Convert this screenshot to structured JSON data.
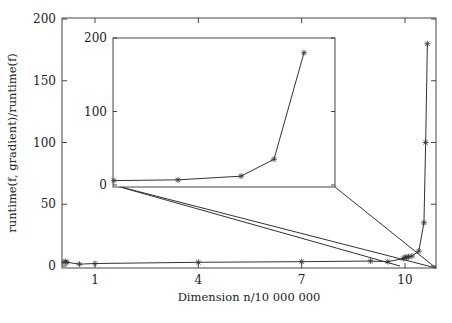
{
  "chart_data": [
    {
      "type": "line",
      "role": "main",
      "title": "",
      "xlabel": "Dimension n/10 000 000",
      "ylabel": "runtime(f, gradient)/runtime(f)",
      "xlim": [
        0.0,
        10.95
      ],
      "ylim": [
        0,
        200
      ],
      "xticks": [
        1,
        4,
        7,
        10
      ],
      "yticks": [
        0,
        50,
        100,
        150,
        200
      ],
      "grid": false,
      "legend": null,
      "series": [
        {
          "name": "runtime ratio",
          "marker": "asterisk",
          "x": [
            0.0,
            0.05,
            0.1,
            0.5,
            1.0,
            4.0,
            7.0,
            9.0,
            9.5,
            9.95,
            10.0,
            10.05,
            10.1,
            10.2,
            10.4,
            10.55,
            10.6,
            10.65
          ],
          "y": [
            3,
            3.5,
            3,
            1.5,
            2,
            3,
            3.5,
            4,
            3.5,
            6,
            7,
            7,
            7.5,
            8,
            12,
            35,
            100,
            180
          ]
        }
      ]
    },
    {
      "type": "line",
      "role": "inset",
      "title": "",
      "xlabel": "",
      "ylabel": "",
      "ylim": [
        0,
        200
      ],
      "yticks": [
        0,
        100,
        200
      ],
      "grid": false,
      "series": [
        {
          "name": "runtime ratio (zoom of dimension 10.0 - 10.65)",
          "marker": "asterisk",
          "x": [
            10.0,
            10.2,
            10.4,
            10.5,
            10.6
          ],
          "y": [
            6,
            7,
            12,
            35,
            180
          ]
        }
      ]
    }
  ],
  "labels": {
    "xlabel": "Dimension n/10 000 000",
    "ylabel": "runtime(f, gradient)/runtime(f)",
    "xticks": [
      "1",
      "4",
      "7",
      "10"
    ],
    "yticks": [
      "0",
      "50",
      "100",
      "150",
      "200"
    ],
    "inset_yticks": [
      "0",
      "100",
      "200"
    ]
  },
  "colors": {
    "line": "#333333",
    "axis": "#444444",
    "text": "#222222"
  }
}
